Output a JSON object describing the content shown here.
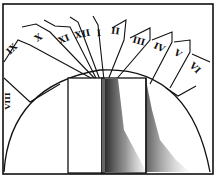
{
  "diagram": {
    "hour_labels": [
      {
        "label": "VIII",
        "x": 10,
        "y": 101,
        "rotate": -90
      },
      {
        "label": "IX",
        "x": 14,
        "y": 51,
        "rotate": -45
      },
      {
        "label": "X",
        "x": 40,
        "y": 40,
        "rotate": -35
      },
      {
        "label": "XI",
        "x": 65,
        "y": 42,
        "rotate": -22
      },
      {
        "label": "XII",
        "x": 83,
        "y": 37,
        "rotate": -12
      },
      {
        "label": "I",
        "x": 99,
        "y": 36,
        "rotate": -5
      },
      {
        "label": "II",
        "x": 115,
        "y": 34,
        "rotate": 8
      },
      {
        "label": "III",
        "x": 138,
        "y": 44,
        "rotate": 15
      },
      {
        "label": "IV",
        "x": 158,
        "y": 50,
        "rotate": 25
      },
      {
        "label": "V",
        "x": 176,
        "y": 56,
        "rotate": 35
      },
      {
        "label": "VI",
        "x": 193,
        "y": 70,
        "rotate": 45
      }
    ],
    "colors": {
      "ink": "#111111",
      "paper": "#ffffff",
      "shadow": "#555555"
    }
  }
}
